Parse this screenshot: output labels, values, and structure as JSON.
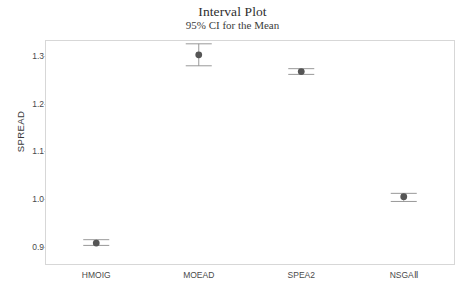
{
  "chart_data": {
    "type": "scatter",
    "title": "Interval Plot",
    "subtitle": "95% CI for the Mean",
    "xlabel": "",
    "ylabel": "SPREAD",
    "categories": [
      "HMOIG",
      "MOEAD",
      "SPEA2",
      "NSGAⅡ"
    ],
    "values": [
      0.908,
      1.302,
      1.267,
      1.005
    ],
    "ci_lower": [
      0.903,
      1.279,
      1.261,
      0.995
    ],
    "ci_upper": [
      0.915,
      1.325,
      1.273,
      1.012
    ],
    "yticks": [
      "0.9",
      "1.0",
      "1.1",
      "1.2",
      "1.3"
    ],
    "ytick_values": [
      0.9,
      1.0,
      1.1,
      1.2,
      1.3
    ],
    "ylim": [
      0.862,
      1.333
    ],
    "grid": false,
    "legend": null,
    "marker_color": "#555555",
    "error_bar_color": "#8d8d8d",
    "frame_color": "#d7d7d7",
    "background_color": "#ffffff"
  }
}
